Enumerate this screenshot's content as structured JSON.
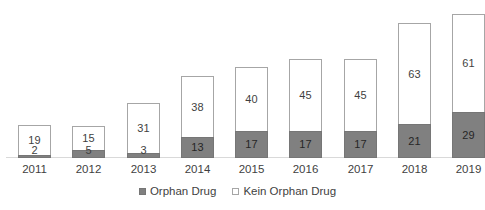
{
  "chart_data": {
    "type": "bar",
    "subtype": "stacked-vertical",
    "title": "",
    "subtitle": "",
    "xlabel": "",
    "ylabel": "",
    "grid": false,
    "axis_visible": {
      "x": true,
      "y": false
    },
    "ylim": [
      0,
      90
    ],
    "categories": [
      "2011",
      "2012",
      "2013",
      "2014",
      "2015",
      "2016",
      "2017",
      "2018",
      "2019"
    ],
    "series": [
      {
        "name": "Orphan Drug",
        "color": "#808080",
        "border_color": "#767676",
        "label_color": "#262626",
        "values": [
          2,
          5,
          3,
          13,
          17,
          17,
          17,
          21,
          29
        ]
      },
      {
        "name": "Kein Orphan Drug",
        "color": "#ffffff",
        "border_color": "#a6a6a6",
        "label_color": "#3f3f3f",
        "values": [
          19,
          15,
          31,
          38,
          40,
          45,
          45,
          63,
          61
        ]
      }
    ],
    "totals": [
      21,
      20,
      34,
      51,
      57,
      62,
      62,
      84,
      90
    ],
    "data_labels_shown": true,
    "legend": {
      "position": "bottom",
      "entries": [
        {
          "label": "Orphan Drug",
          "marker": "filled-square",
          "color": "#808080"
        },
        {
          "label": "Kein Orphan Drug",
          "marker": "outlined-square",
          "color": "#ffffff"
        }
      ]
    },
    "axis_color": "#d9d9d9",
    "background": "#ffffff"
  }
}
